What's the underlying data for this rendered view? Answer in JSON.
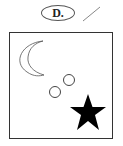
{
  "option": {
    "label": "D."
  },
  "mark": {
    "type": "slash",
    "color": "#888888"
  },
  "figure": {
    "shapes": [
      {
        "name": "crescent-moon",
        "style": "outline"
      },
      {
        "name": "circle",
        "style": "outline"
      },
      {
        "name": "circle",
        "style": "outline"
      },
      {
        "name": "star",
        "style": "filled",
        "color": "#000000"
      }
    ]
  }
}
